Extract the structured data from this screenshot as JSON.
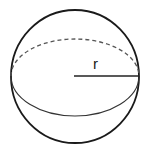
{
  "diagram": {
    "type": "sphere",
    "radius_label": "r",
    "colors": {
      "outline": "#1a1a1a",
      "equator_front": "#333333",
      "equator_back_dashed": "#555555",
      "radius_line": "#222222",
      "background": "#ffffff"
    },
    "geometry": {
      "center": [
        75,
        76
      ],
      "sphere_rx": 64,
      "sphere_ry": 66,
      "equator_rx": 64,
      "equator_ry": 39
    }
  }
}
